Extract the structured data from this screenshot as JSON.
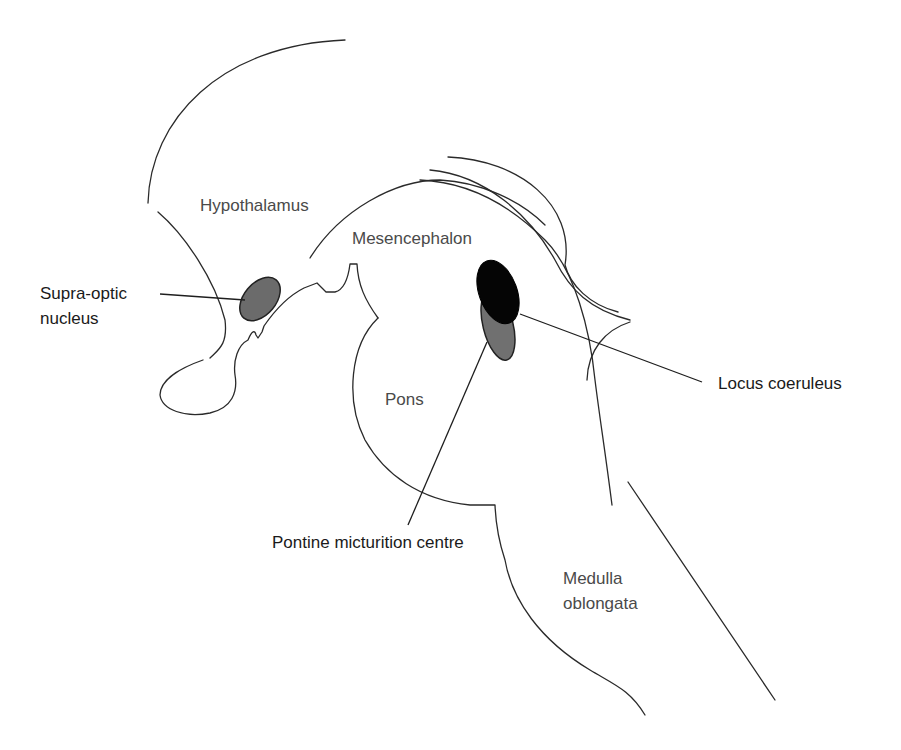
{
  "diagram": {
    "type": "anatomical-sagittal-brainstem",
    "regions": {
      "hypothalamus": "Hypothalamus",
      "mesencephalon": "Mesencephalon",
      "pons": "Pons",
      "medulla_line1": "Medulla",
      "medulla_line2": "oblongata"
    },
    "callouts": {
      "supra_optic_line1": "Supra-optic",
      "supra_optic_line2": "nucleus",
      "locus_coeruleus": "Locus coeruleus",
      "pontine_micturition_centre": "Pontine micturition centre"
    },
    "colors": {
      "supra_optic_fill": "#6b6b6b",
      "locus_coeruleus_fill": "#050505",
      "pontine_micturition_fill": "#707070",
      "outline": "#2a2a2a",
      "background": "#ffffff"
    }
  }
}
